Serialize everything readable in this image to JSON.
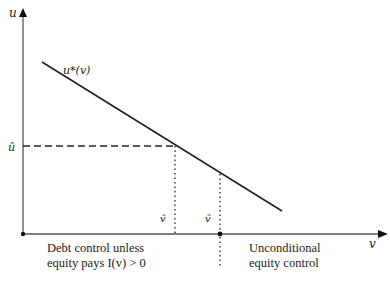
{
  "diagram": {
    "axes": {
      "y_label": "u",
      "x_label": "v"
    },
    "curve_label": "u*(v)",
    "u_hat_label": "û",
    "v_hat_label": "v̂",
    "v_tilde_label": "ṽ",
    "regions": {
      "left_line1": "Debt control unless",
      "left_line2": "equity pays I(v) > 0",
      "right_line1": "Unconditional",
      "right_line2": "equity control"
    },
    "colors": {
      "ink": "#222222",
      "axis": "#555555"
    }
  }
}
